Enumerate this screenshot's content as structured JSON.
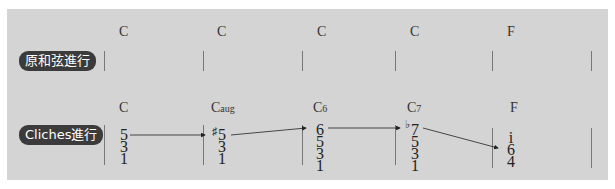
{
  "rows": [
    {
      "label": "原和弦進行",
      "chords": [
        "C",
        "C",
        "C",
        "C",
        "F"
      ]
    },
    {
      "label": "Cliches進行",
      "chords": [
        {
          "root": "C",
          "suffix": ""
        },
        {
          "root": "C",
          "suffix": "aug"
        },
        {
          "root": "C",
          "suffix": "6"
        },
        {
          "root": "C",
          "suffix": "7"
        },
        {
          "root": "F",
          "suffix": ""
        }
      ],
      "voicings": [
        [
          "5",
          "3",
          "1"
        ],
        [
          "5",
          "3",
          "1"
        ],
        [
          "6",
          "5",
          "3",
          "1"
        ],
        [
          "7",
          "5",
          "3",
          "1"
        ],
        [
          "i",
          "6",
          "4"
        ]
      ],
      "accidentals": {
        "sharp": "♯",
        "flat": "♭"
      },
      "top_voice_line": [
        "5",
        "♯5",
        "6",
        "♭7",
        "6"
      ]
    }
  ],
  "colors": {
    "panel": "#d4d4d4",
    "badge": "#3b3b3b",
    "text": "#222222"
  }
}
